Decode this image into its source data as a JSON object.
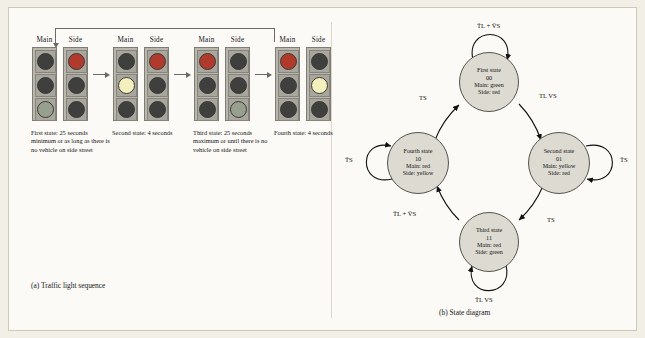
{
  "figure": {
    "background": "#f2efe6",
    "panel_background": "#fbfaf6"
  },
  "part_a": {
    "caption": "(a)  Traffic light sequence",
    "groups": [
      {
        "main_header": "Main",
        "side_header": "Side",
        "main_lights": [
          "off",
          "off",
          "green"
        ],
        "side_lights": [
          "red",
          "off",
          "off"
        ],
        "caption": "First state: 25 seconds minimum or as long as there is no vehicle on side street"
      },
      {
        "main_header": "Main",
        "side_header": "Side",
        "main_lights": [
          "off",
          "yellow",
          "off"
        ],
        "side_lights": [
          "red",
          "off",
          "off"
        ],
        "caption": "Second state: 4 seconds"
      },
      {
        "main_header": "Main",
        "side_header": "Side",
        "main_lights": [
          "red",
          "off",
          "off"
        ],
        "side_lights": [
          "off",
          "off",
          "green"
        ],
        "caption": "Third state: 25 seconds maximum or until there is no vehicle on side street"
      },
      {
        "main_header": "Main",
        "side_header": "Side",
        "main_lights": [
          "red",
          "off",
          "off"
        ],
        "side_lights": [
          "off",
          "yellow",
          "off"
        ],
        "caption": "Fourth state: 4 seconds"
      }
    ]
  },
  "part_b": {
    "caption": "(b)  State diagram",
    "states": [
      {
        "id": "first",
        "title": "First state",
        "code": "00",
        "main": "Main: green",
        "side": "Side: red"
      },
      {
        "id": "second",
        "title": "Second state",
        "code": "01",
        "main": "Main: yellow",
        "side": "Side: red"
      },
      {
        "id": "third",
        "title": "Third state",
        "code": "11",
        "main": "Main: red",
        "side": "Side: green"
      },
      {
        "id": "fourth",
        "title": "Fourth state",
        "code": "10",
        "main": "Main: red",
        "side": "Side: yellow"
      }
    ],
    "edge_labels": {
      "first_self": "T̄L + V̄S",
      "first_to_second": "TL VS",
      "second_self": "T̄S",
      "second_to_third": "TS",
      "third_self": "T̄L VS",
      "third_to_fourth": "T̄L + V̄S",
      "fourth_self": "T̄S",
      "fourth_to_first": "TS"
    }
  },
  "colors": {
    "panel_border": "#cfc9b8",
    "red_lamp": "#b03a2b",
    "yellow_lamp": "#f4f0bd",
    "green_lamp": "#97a08f",
    "off_lamp": "#3f3f3e",
    "node_fill": "#dcdad1",
    "stroke": "#55534d"
  }
}
